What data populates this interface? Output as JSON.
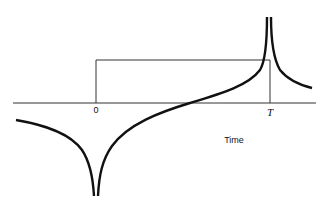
{
  "diagram": {
    "labels": {
      "origin": "0",
      "pulse_end": "T",
      "x_axis": "Time"
    },
    "colors": {
      "curve": "#111111",
      "pulse": "#333333",
      "axis": "#333333",
      "background": "#ffffff"
    }
  }
}
